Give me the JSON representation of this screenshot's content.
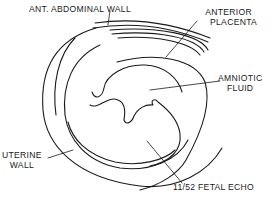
{
  "figure": {
    "line_color": "#1a1a1a",
    "background": "#ffffff"
  },
  "labels": {
    "abdominal_wall": "ANT. ABDOMINAL WALL",
    "placenta_line1": "ANTERIOR",
    "placenta_line2": "PLACENTA",
    "amniotic_line1": "AMNIOTIC",
    "amniotic_line2": "FLUID",
    "uterine_line1": "UTERINE",
    "uterine_line2": "WALL",
    "fetal_echo": "11/52 FETAL ECHO"
  }
}
